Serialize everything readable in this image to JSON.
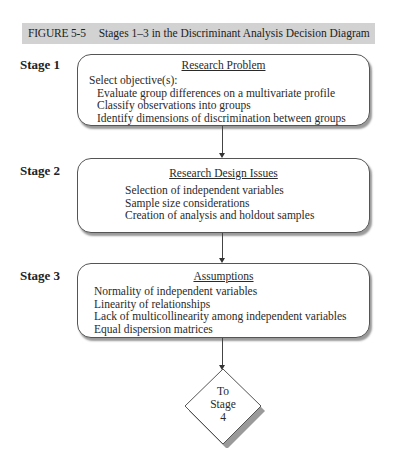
{
  "figure": {
    "number": "FIGURE 5-5",
    "caption": "Stages 1–3 in the Discriminant Analysis Decision Diagram"
  },
  "stages": [
    {
      "label": "Stage 1",
      "title": "Research Problem",
      "intro": "Select objective(s):",
      "items": [
        "Evaluate group differences on a multivariate profile",
        "Classify observations into groups",
        "Identify dimensions of discrimination between groups"
      ]
    },
    {
      "label": "Stage 2",
      "title": "Research Design Issues",
      "items": [
        "Selection of independent variables",
        "Sample size considerations",
        "Creation of analysis and holdout samples"
      ]
    },
    {
      "label": "Stage 3",
      "title": "Assumptions",
      "items": [
        "Normality of independent variables",
        "Linearity of relationships",
        "Lack of multicollinearity among independent variables",
        "Equal dispersion matrices"
      ]
    }
  ],
  "connector": {
    "lines": [
      "To",
      "Stage",
      "4"
    ]
  },
  "colors": {
    "title_bar_bg": "#d2d2d2",
    "box_border": "#555555",
    "box_shadow": "#9a9a9a"
  }
}
